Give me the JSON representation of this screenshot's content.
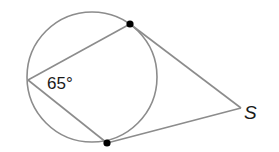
{
  "diagram": {
    "type": "circle-geometry",
    "angle_label": "65°",
    "point_label": "S",
    "colors": {
      "stroke": "#8c8c8c",
      "point": "#000000",
      "text": "#1a1a1a"
    },
    "circle": {
      "cx": 92,
      "cy": 77,
      "r": 65
    },
    "points": {
      "left_vertex": [
        28,
        80
      ],
      "top_tangent": [
        130,
        24
      ],
      "bottom_tangent": [
        107,
        143
      ],
      "S": [
        241,
        108
      ]
    }
  }
}
